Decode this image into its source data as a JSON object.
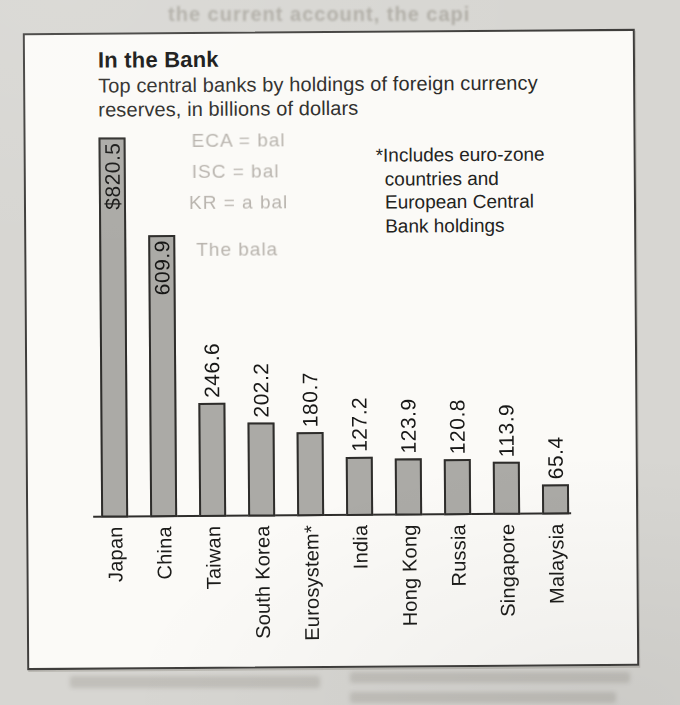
{
  "chart_box": {
    "title": "In the Bank",
    "subtitle_line1": "Top central banks by holdings of foreign currency",
    "subtitle_line2": "reserves, in billions of dollars",
    "footnote_lines": [
      "*Includes euro-zone",
      "countries and",
      "European Central",
      "Bank holdings"
    ],
    "colors": {
      "page_bg": "#d7d6d2",
      "box_bg": "#fbfaf7",
      "box_border": "#3f3e3c",
      "bar_fill": "#abaaa6",
      "bar_border": "#2e2d2b",
      "text": "#1c1c1a"
    }
  },
  "chart_data": {
    "type": "bar",
    "title": "In the Bank",
    "subtitle": "Top central banks by holdings of foreign currency reserves, in billions of dollars",
    "orientation": "vertical-bars",
    "categories": [
      "Japan",
      "China",
      "Taiwan",
      "South Korea",
      "Eurosystem*",
      "India",
      "Hong Kong",
      "Russia",
      "Singapore",
      "Malaysia"
    ],
    "values": [
      820.5,
      609.9,
      246.6,
      202.2,
      180.7,
      127.2,
      123.9,
      120.8,
      113.9,
      65.4
    ],
    "value_labels": [
      "$820.5",
      "609.9",
      "246.6",
      "202.2",
      "180.7",
      "127.2",
      "123.9",
      "120.8",
      "113.9",
      "65.4"
    ],
    "unit": "billions of dollars",
    "footnote": "*Includes euro-zone countries and European Central Bank holdings",
    "ylim": [
      0,
      850
    ],
    "grid": false,
    "legend": false,
    "label_style": "rotated bottom-to-top, first two labels inside bars"
  },
  "ghost_text": {
    "note": "faint show-through print from the scanned newspaper page",
    "top_line": "the current account, the capi",
    "fragments": [
      "ECA = bal",
      "ISC = bal",
      "KR = a bal",
      "The bala"
    ]
  }
}
